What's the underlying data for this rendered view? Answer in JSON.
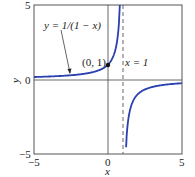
{
  "chart_data": {
    "type": "line",
    "title": "",
    "function_label": "y = 1/(1 − x)",
    "xlabel": "x",
    "ylabel": "y",
    "xlim": [
      -5,
      5
    ],
    "ylim": [
      -5,
      5
    ],
    "xticks": [
      "−5",
      "0",
      "5"
    ],
    "yticks": [
      "5",
      "0",
      "−5"
    ],
    "grid": false,
    "series": [
      {
        "name": "y = 1/(1 − x)",
        "color": "#2a3fb0",
        "x": [
          -5,
          -4,
          -3,
          -2,
          -1,
          0,
          0.5,
          0.8,
          0.9,
          1.1,
          1.2,
          1.5,
          2,
          3,
          4,
          5
        ],
        "y": [
          0.167,
          0.2,
          0.25,
          0.333,
          0.5,
          1,
          2,
          5,
          10,
          -10,
          -5,
          -2,
          -1,
          -0.5,
          -0.333,
          -0.25
        ]
      }
    ],
    "annotations": [
      {
        "text": "(0, 1)",
        "x": 0,
        "y": 1,
        "marker": "point"
      },
      {
        "text": "x = 1",
        "type": "vertical-asymptote",
        "x": 1,
        "style": "dashed"
      }
    ]
  },
  "labels": {
    "func": "y = 1/(1 − x)",
    "point": "(0, 1)",
    "asym": "x = 1",
    "xlabel": "x",
    "ylabel": "y",
    "ytop": "5",
    "ymid": "0",
    "ybot": "−5",
    "xleft": "−5",
    "xmid": "0",
    "xright": "5"
  }
}
